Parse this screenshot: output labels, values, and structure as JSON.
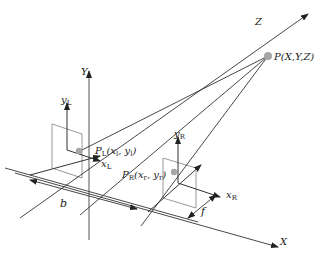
{
  "diagram": {
    "colors": {
      "line": "#333333",
      "plane": "#999999",
      "point": "#a6a6a6"
    },
    "world_axes": {
      "X": "X",
      "Y": "Y",
      "Z": "Z"
    },
    "object_point": {
      "label": "P(X,Y,Z)"
    },
    "left_camera": {
      "y_axis": "y",
      "y_sub": "L",
      "x_axis": "x",
      "x_sub": "L",
      "image_point_main": "P",
      "image_point_sub": "L",
      "image_point_coords": "(x",
      "image_point_coords_sub1": "l",
      "image_point_mid": ", y",
      "image_point_coords_sub2": "l",
      "image_point_close": ")"
    },
    "right_camera": {
      "y_axis": "y",
      "y_sub": "R",
      "x_axis": "x",
      "x_sub": "R",
      "image_point_main": "P",
      "image_point_sub": "R",
      "image_point_coords": "(x",
      "image_point_coords_sub1": "r",
      "image_point_mid": ", y",
      "image_point_coords_sub2": "r",
      "image_point_close": ")"
    },
    "dimensions": {
      "baseline": "b",
      "focal_length": "f"
    }
  }
}
